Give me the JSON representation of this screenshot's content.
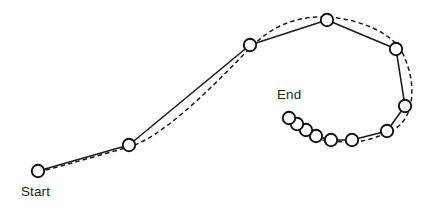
{
  "figure": {
    "title": "",
    "background_color": "#ffffff",
    "stroke_color": "#1a1a1a",
    "node_fill_color": "#ffffff",
    "node_stroke_color": "#111111",
    "label_color": "#231f20",
    "node_radius": 6.2
  },
  "labels": {
    "start": "Start",
    "end": "End"
  },
  "label_positions": {
    "start": {
      "x": 21,
      "y": 196
    },
    "end": {
      "x": 277,
      "y": 99
    }
  },
  "chart_data": {
    "type": "line",
    "title": "",
    "xlabel": "",
    "ylabel": "",
    "xlim": [
      0,
      434
    ],
    "ylim": [
      0,
      208
    ],
    "grid": false,
    "legend": "none",
    "annotations": [
      {
        "text": "Start",
        "x": 38,
        "y": 171,
        "placement": "below-left"
      },
      {
        "text": "End",
        "x": 289,
        "y": 118,
        "placement": "above"
      }
    ],
    "series": [
      {
        "name": "measured-waypoints",
        "style": "solid-polyline-with-circle-markers",
        "marker": "open-circle",
        "points": [
          {
            "x": 38,
            "y": 171
          },
          {
            "x": 129,
            "y": 145
          },
          {
            "x": 250,
            "y": 45
          },
          {
            "x": 327,
            "y": 20
          },
          {
            "x": 396,
            "y": 49
          },
          {
            "x": 405,
            "y": 106
          },
          {
            "x": 387,
            "y": 131
          },
          {
            "x": 352,
            "y": 140
          },
          {
            "x": 331,
            "y": 140
          },
          {
            "x": 316,
            "y": 136
          },
          {
            "x": 306,
            "y": 130
          },
          {
            "x": 297,
            "y": 124
          },
          {
            "x": 289,
            "y": 118
          }
        ]
      },
      {
        "name": "smoothed-trajectory",
        "style": "dashed-curve",
        "marker": "none",
        "points": [
          {
            "x": 38,
            "y": 171
          },
          {
            "x": 129,
            "y": 145
          },
          {
            "x": 250,
            "y": 45
          },
          {
            "x": 327,
            "y": 20
          },
          {
            "x": 396,
            "y": 49
          },
          {
            "x": 405,
            "y": 106
          },
          {
            "x": 387,
            "y": 131
          },
          {
            "x": 352,
            "y": 140
          },
          {
            "x": 331,
            "y": 140
          },
          {
            "x": 316,
            "y": 136
          },
          {
            "x": 306,
            "y": 130
          },
          {
            "x": 297,
            "y": 124
          },
          {
            "x": 289,
            "y": 118
          }
        ]
      }
    ],
    "paths": {
      "solid_d": "M 38,171 L 129,145 L 250,45 L 327,20 L 396,49 L 405,106 L 387,131 L 352,140 L 331,140 L 316,136 L 306,130 L 297,124 L 289,118",
      "dashed_d": "M 38,172 C 70,164 100,155 129,147 C 160,138 205,95 250,48 C 275,23 300,16 327,17 C 360,19 392,33 402,52 C 412,72 414,92 410,107 C 406,122 396,130 387,133 C 372,139 362,142 352,142 C 340,142 334,141 330,141 C 322,141 318,138 315,136 C 308,132 303,128 297,124 C 294,122 291,120 289,118"
    }
  }
}
